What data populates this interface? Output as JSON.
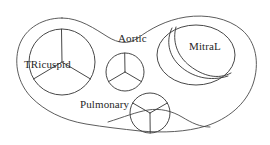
{
  "diagram": {
    "background_color": "#ffffff",
    "stroke_color": "#3d3d3d",
    "outline_color": "#4a4a4a",
    "labels": {
      "tricuspid": "TRicuspid",
      "aortic": "Aortic",
      "mitral": "MitraL",
      "pulmonary": "Pulmonary"
    },
    "valves": [
      {
        "name": "tricuspid",
        "label": "TRicuspid",
        "shape": "circle",
        "cusps": 3,
        "cusp_pattern": "y-upright",
        "center": [
          62,
          62
        ],
        "radius": 33
      },
      {
        "name": "aortic",
        "label": "Aortic",
        "shape": "circle",
        "cusps": 3,
        "cusp_pattern": "y-upright",
        "center": [
          125,
          72
        ],
        "radius": 19
      },
      {
        "name": "mitral",
        "label": "MitraL",
        "shape": "ellipse",
        "cusps": 2,
        "cusp_pattern": "s-curve",
        "center": [
          196,
          55
        ],
        "radius_x": 39,
        "radius_y": 30
      },
      {
        "name": "pulmonary",
        "label": "Pulmonary",
        "shape": "circle",
        "cusps": 3,
        "cusp_pattern": "y-inverted",
        "center": [
          150,
          113
        ],
        "radius": 20
      }
    ]
  }
}
